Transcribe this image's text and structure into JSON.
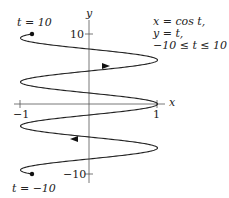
{
  "chart_data": {
    "type": "line",
    "title": "",
    "xlabel": "x",
    "ylabel": "y",
    "xlim": [
      -1,
      1
    ],
    "ylim": [
      -10,
      10
    ],
    "x_ticks": [
      "-1",
      "1"
    ],
    "y_ticks": [
      "10",
      "-10"
    ],
    "grid": false,
    "series": [
      {
        "name": "parametric curve x = cos t, y = t",
        "t_range": [
          -10,
          10
        ],
        "x_expr": "cos t",
        "y_expr": "t"
      }
    ],
    "annotations": {
      "start_label": "t = -10",
      "end_label": "t = 10",
      "equations": [
        "x = cos t,",
        "y = t,",
        "-10 ≤ t ≤ 10"
      ],
      "direction": "increasing t, upward"
    }
  },
  "labels": {
    "x_axis": "x",
    "y_axis": "y",
    "x_tick_neg": "−1",
    "x_tick_pos": "1",
    "y_tick_pos": "10",
    "y_tick_neg": "−10",
    "t_end": "t = 10",
    "t_start": "t = −10",
    "eq1": "x = cos t,",
    "eq2": "y = t,",
    "eq3": "−10 ≤ t ≤ 10"
  }
}
